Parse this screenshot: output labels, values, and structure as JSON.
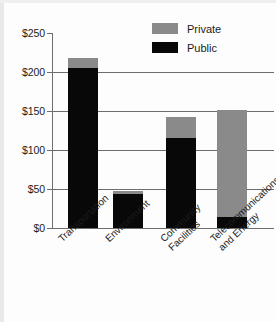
{
  "chart_data": {
    "type": "bar",
    "title": "",
    "subtitle": "",
    "xlabel": "",
    "ylabel": "",
    "stacked": true,
    "grid": true,
    "legend_position": "top-right",
    "ylim": [
      0,
      250
    ],
    "yticks": [
      0,
      50,
      100,
      150,
      200,
      250
    ],
    "ytick_labels": [
      "$0",
      "$50",
      "$100",
      "$150",
      "$200",
      "$250"
    ],
    "categories": [
      "Transportation",
      "Environment",
      "Community Facilities",
      "Telecommunications and Energy"
    ],
    "category_lines": [
      [
        "Transportation"
      ],
      [
        "Environment"
      ],
      [
        "Community",
        "Facilities"
      ],
      [
        "Telecommunications",
        "and Energy"
      ]
    ],
    "series": [
      {
        "name": "Public",
        "color": "#080808",
        "values": [
          205,
          44,
          115,
          14
        ]
      },
      {
        "name": "Private",
        "color": "#8a8a8a",
        "values": [
          13,
          3,
          27,
          137
        ]
      }
    ],
    "totals": [
      218,
      47,
      142,
      151
    ]
  },
  "legend": {
    "items": [
      {
        "label": "Private",
        "color": "#8a8a8a"
      },
      {
        "label": "Public",
        "color": "#080808"
      }
    ]
  },
  "axis": {
    "y": {
      "labels": [
        "$250",
        "$200",
        "$150",
        "$100",
        "$50",
        "$0"
      ],
      "values": [
        250,
        200,
        150,
        100,
        50,
        0
      ]
    }
  }
}
